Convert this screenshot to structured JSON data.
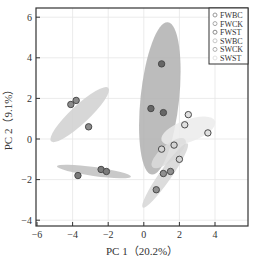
{
  "chart_data": {
    "type": "scatter",
    "title": "",
    "xlabel": "PC 1（20.2%）",
    "ylabel": "PC 2（9.1%）",
    "xlim": [
      -6,
      6
    ],
    "ylim": [
      -4.3,
      6.5
    ],
    "xticks": [
      -6,
      -4,
      -2,
      0,
      2,
      4
    ],
    "yticks": [
      -4,
      -2,
      0,
      2,
      4,
      6
    ],
    "grid": true,
    "legend_position": "upper right",
    "series": [
      {
        "name": "FWBC",
        "marker_fill": "#8c8c8c",
        "ellipse": {
          "cx": -3.6,
          "cy": 1.2,
          "rx": 2.2,
          "ry": 0.45,
          "angle_deg": -43,
          "fill": "#d0d0d0"
        },
        "points": [
          [
            -4.1,
            1.7
          ],
          [
            -3.8,
            1.9
          ],
          [
            -3.1,
            0.6
          ]
        ]
      },
      {
        "name": "FWCK",
        "marker_fill": "#7a7a7a",
        "ellipse": {
          "cx": -2.8,
          "cy": -1.6,
          "rx": 2.1,
          "ry": 0.22,
          "angle_deg": 8,
          "fill": "#c0c0c0"
        },
        "points": [
          [
            -3.7,
            -1.8
          ],
          [
            -2.4,
            -1.5
          ],
          [
            -2.1,
            -1.6
          ]
        ]
      },
      {
        "name": "FWST",
        "marker_fill": "#666666",
        "ellipse": {
          "cx": 0.9,
          "cy": 2.0,
          "rx": 4.3,
          "ry": 0.95,
          "angle_deg": -84,
          "fill": "#b0b0b0"
        },
        "points": [
          [
            1.0,
            3.7
          ],
          [
            0.4,
            1.5
          ],
          [
            1.1,
            1.3
          ]
        ]
      },
      {
        "name": "SWBC",
        "marker_fill": "#e0e0e0",
        "ellipse": {
          "cx": 2.5,
          "cy": 0.4,
          "rx": 1.6,
          "ry": 0.55,
          "angle_deg": -20,
          "fill": "#ebebeb"
        },
        "points": [
          [
            2.5,
            1.2
          ],
          [
            2.3,
            0.7
          ],
          [
            3.6,
            0.3
          ]
        ]
      },
      {
        "name": "SWCK",
        "marker_fill": "#d4d4d4",
        "ellipse": {
          "cx": 1.4,
          "cy": -0.7,
          "rx": 1.2,
          "ry": 0.4,
          "angle_deg": -40,
          "fill": "#dcdcdc"
        },
        "points": [
          [
            1.0,
            -0.5
          ],
          [
            1.7,
            -0.3
          ],
          [
            2.0,
            -1.0
          ]
        ]
      },
      {
        "name": "SWST",
        "marker_fill": "#909090",
        "ellipse": {
          "cx": 1.2,
          "cy": -1.8,
          "rx": 2.2,
          "ry": 0.3,
          "angle_deg": -55,
          "fill": "#d6d6d6"
        },
        "points": [
          [
            1.5,
            -1.6
          ],
          [
            1.1,
            -1.7
          ],
          [
            0.7,
            -2.5
          ]
        ]
      }
    ]
  },
  "legend": {
    "items": [
      {
        "label": "FWBC",
        "color": "#9a9a9a"
      },
      {
        "label": "FWCK",
        "color": "#a8a8a8"
      },
      {
        "label": "FWST",
        "color": "#8a8a8a"
      },
      {
        "label": "SWBC",
        "color": "#c8c8c8"
      },
      {
        "label": "SWCK",
        "color": "#b0b0b0"
      },
      {
        "label": "SWST",
        "color": "#e2e2e2"
      }
    ]
  }
}
